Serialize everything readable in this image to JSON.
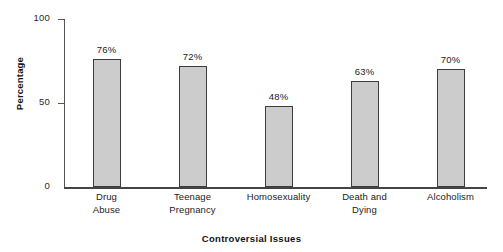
{
  "chart_data": {
    "type": "bar",
    "title": "",
    "xlabel": "Controversial Issues",
    "ylabel": "Percentage",
    "categories": [
      "Drug Abuse",
      "Teenage Pregnancy",
      "Homosexuality",
      "Death and Dying",
      "Alcoholism"
    ],
    "category_lines": [
      [
        "Drug",
        "Abuse"
      ],
      [
        "Teenage",
        "Pregnancy"
      ],
      [
        "Homosexuality",
        ""
      ],
      [
        "Death and",
        "Dying"
      ],
      [
        "Alcoholism",
        ""
      ]
    ],
    "values": [
      76,
      72,
      48,
      63,
      70
    ],
    "value_labels": [
      "76%",
      "72%",
      "48%",
      "63%",
      "70%"
    ],
    "ylim": [
      0,
      100
    ],
    "yticks": [
      0,
      50,
      100
    ],
    "ytick_labels": [
      "0",
      "50",
      "100"
    ],
    "grid": false,
    "legend": false,
    "colors": {
      "bar_fill": "#cccccc",
      "bar_border": "#3d3d3d",
      "axis": "#444444",
      "text": "#222222",
      "background": "#ffffff"
    }
  }
}
